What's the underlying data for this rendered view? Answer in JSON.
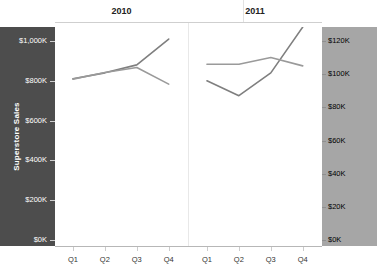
{
  "chart_data": {
    "type": "line",
    "title": "",
    "subtitle": "",
    "panels": [
      "2010",
      "2011"
    ],
    "categories": [
      "Q1",
      "Q2",
      "Q3",
      "Q4"
    ],
    "xlabel": "",
    "grid": false,
    "legend_position": "none",
    "axes": {
      "left": {
        "label": "Superstore Sales",
        "ticks": [
          "$0K",
          "$200K",
          "$400K",
          "$600K",
          "$800K",
          "$1,000K"
        ],
        "tick_values": [
          0,
          200000,
          400000,
          600000,
          800000,
          1000000
        ],
        "ylim": [
          0,
          1000000
        ],
        "band_color": "#4d4d4d",
        "text_color": "#ffffff"
      },
      "right": {
        "label": "Coffee Chain Sales",
        "ticks": [
          "$0K",
          "$20K",
          "$40K",
          "$60K",
          "$80K",
          "$100K",
          "$120K"
        ],
        "tick_values": [
          0,
          20000,
          40000,
          60000,
          80000,
          100000,
          120000
        ],
        "ylim": [
          0,
          120000
        ],
        "band_color": "#a6a6a6",
        "text_color": "#000000"
      }
    },
    "series": [
      {
        "name": "Superstore Sales",
        "axis": "left",
        "color": "#7f7f7f",
        "panel_values": {
          "2010": [
            810000,
            840000,
            880000,
            1010000
          ],
          "2011": [
            800000,
            725000,
            840000,
            1070000
          ]
        }
      },
      {
        "name": "Coffee Chain Sales",
        "axis": "right",
        "color": "#9a9a9a",
        "panel_values": {
          "2010": [
            97000,
            101000,
            104000,
            94000
          ],
          "2011": [
            106000,
            106000,
            110000,
            105000
          ]
        }
      }
    ]
  },
  "chart": {
    "left_axis": {
      "title": "Superstore Sales",
      "ticks": [
        {
          "label": "$1,000K",
          "value": 1000000
        },
        {
          "label": "$800K",
          "value": 800000
        },
        {
          "label": "$600K",
          "value": 600000
        },
        {
          "label": "$400K",
          "value": 400000
        },
        {
          "label": "$200K",
          "value": 200000
        },
        {
          "label": "$0K",
          "value": 0
        }
      ]
    },
    "right_axis": {
      "title": "Coffee Chain Sales",
      "ticks": [
        {
          "label": "$120K",
          "value": 120000
        },
        {
          "label": "$100K",
          "value": 100000
        },
        {
          "label": "$80K",
          "value": 80000
        },
        {
          "label": "$60K",
          "value": 60000
        },
        {
          "label": "$40K",
          "value": 40000
        },
        {
          "label": "$20K",
          "value": 20000
        },
        {
          "label": "$0K",
          "value": 0
        }
      ]
    },
    "panels": [
      {
        "header": "2010",
        "x_labels": [
          "Q1",
          "Q2",
          "Q3",
          "Q4"
        ]
      },
      {
        "header": "2011",
        "x_labels": [
          "Q1",
          "Q2",
          "Q3",
          "Q4"
        ]
      }
    ]
  }
}
